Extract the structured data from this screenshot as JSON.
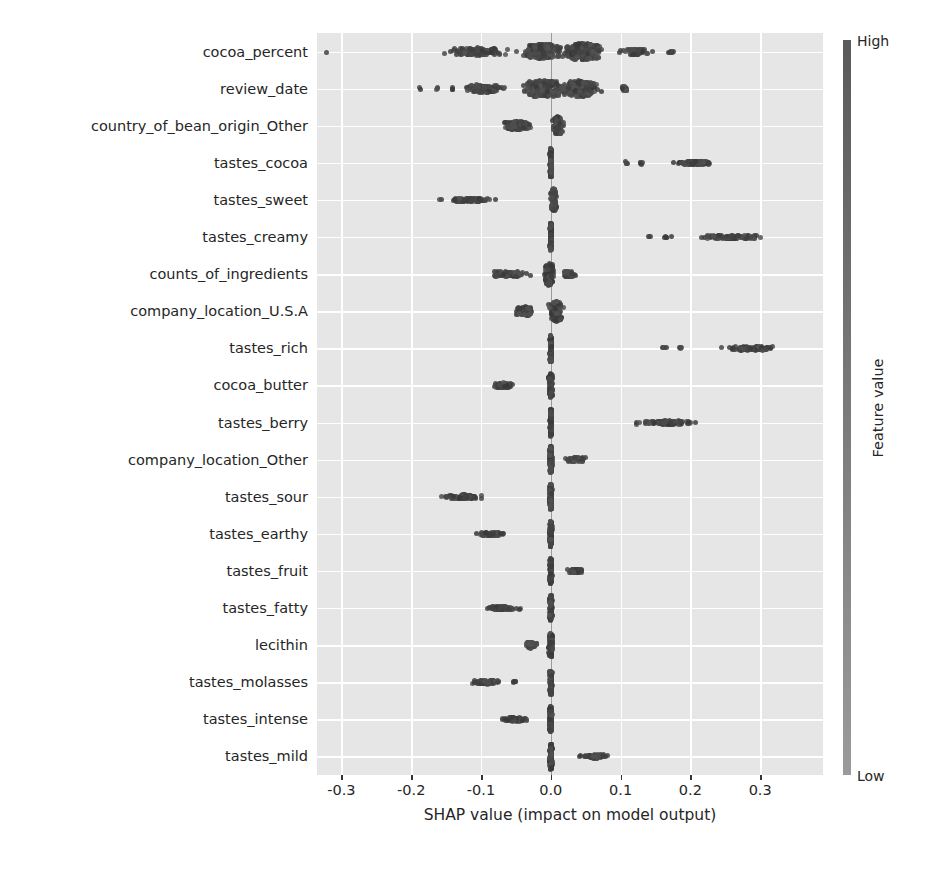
{
  "chart_data": {
    "type": "scatter",
    "plot_kind": "shap-beeswarm",
    "title": "",
    "xlabel": "SHAP value (impact on model output)",
    "ylabel": "",
    "xlim": [
      -0.335,
      0.39
    ],
    "xticks": [
      -0.3,
      -0.2,
      -0.1,
      0.0,
      0.1,
      0.2,
      0.3
    ],
    "xtick_labels": [
      "-0.3",
      "-0.2",
      "-0.1",
      "0.0",
      "0.1",
      "0.2",
      "0.3"
    ],
    "grid": true,
    "grid_color": "#ffffff",
    "plot_background": "#e6e6e6",
    "point_color": "#4a4a4a",
    "legend": {
      "type": "colorbar",
      "title": "Feature value",
      "high_label": "High",
      "low_label": "Low",
      "position": "right",
      "gradient_top": "#5a5a5a",
      "gradient_bottom": "#9a9a9a"
    },
    "categories": [
      "cocoa_percent",
      "review_date",
      "country_of_bean_origin_Other",
      "tastes_cocoa",
      "tastes_sweet",
      "tastes_creamy",
      "counts_of_ingredients",
      "company_location_U.S.A",
      "tastes_rich",
      "cocoa_butter",
      "tastes_berry",
      "company_location_Other",
      "tastes_sour",
      "tastes_earthy",
      "tastes_fruit",
      "tastes_fatty",
      "lecithin",
      "tastes_molasses",
      "tastes_intense",
      "tastes_mild"
    ],
    "series": [
      {
        "name": "cocoa_percent",
        "clusters": [
          {
            "center": -0.322,
            "half_width": 0.004,
            "count": 1,
            "spread": 0.5
          },
          {
            "center": -0.105,
            "half_width": 0.055,
            "count": 120,
            "spread": 1.3
          },
          {
            "center": -0.012,
            "half_width": 0.042,
            "count": 210,
            "spread": 2.6
          },
          {
            "center": 0.045,
            "half_width": 0.04,
            "count": 230,
            "spread": 3.0
          },
          {
            "center": 0.122,
            "half_width": 0.028,
            "count": 55,
            "spread": 1.0
          },
          {
            "center": 0.173,
            "half_width": 0.012,
            "count": 8,
            "spread": 0.5
          }
        ]
      },
      {
        "name": "review_date",
        "clusters": [
          {
            "center": -0.188,
            "half_width": 0.004,
            "count": 2,
            "spread": 0.5
          },
          {
            "center": -0.16,
            "half_width": 0.006,
            "count": 3,
            "spread": 0.5
          },
          {
            "center": -0.14,
            "half_width": 0.006,
            "count": 3,
            "spread": 0.5
          },
          {
            "center": -0.095,
            "half_width": 0.045,
            "count": 110,
            "spread": 1.4
          },
          {
            "center": -0.01,
            "half_width": 0.04,
            "count": 230,
            "spread": 3.0
          },
          {
            "center": 0.04,
            "half_width": 0.038,
            "count": 215,
            "spread": 2.8
          },
          {
            "center": 0.105,
            "half_width": 0.01,
            "count": 14,
            "spread": 0.7
          }
        ]
      },
      {
        "name": "country_of_bean_origin_Other",
        "clusters": [
          {
            "center": -0.048,
            "half_width": 0.03,
            "count": 110,
            "spread": 1.5
          },
          {
            "center": 0.01,
            "half_width": 0.01,
            "count": 130,
            "spread": 3.2
          }
        ]
      },
      {
        "name": "tastes_cocoa",
        "clusters": [
          {
            "center": 0.0,
            "half_width": 0.002,
            "count": 150,
            "spread": 5.2
          },
          {
            "center": 0.108,
            "half_width": 0.004,
            "count": 4,
            "spread": 0.5
          },
          {
            "center": 0.13,
            "half_width": 0.006,
            "count": 5,
            "spread": 0.5
          },
          {
            "center": 0.205,
            "half_width": 0.045,
            "count": 95,
            "spread": 0.7
          }
        ]
      },
      {
        "name": "tastes_sweet",
        "clusters": [
          {
            "center": -0.118,
            "half_width": 0.05,
            "count": 95,
            "spread": 0.7
          },
          {
            "center": 0.004,
            "half_width": 0.006,
            "count": 140,
            "spread": 4.2
          }
        ]
      },
      {
        "name": "tastes_creamy",
        "clusters": [
          {
            "center": 0.0,
            "half_width": 0.002,
            "count": 140,
            "spread": 5.0
          },
          {
            "center": 0.142,
            "half_width": 0.004,
            "count": 3,
            "spread": 0.5
          },
          {
            "center": 0.166,
            "half_width": 0.008,
            "count": 5,
            "spread": 0.5
          },
          {
            "center": 0.255,
            "half_width": 0.06,
            "count": 105,
            "spread": 0.7
          }
        ]
      },
      {
        "name": "counts_of_ingredients",
        "clusters": [
          {
            "center": -0.06,
            "half_width": 0.04,
            "count": 70,
            "spread": 1.0
          },
          {
            "center": -0.002,
            "half_width": 0.01,
            "count": 130,
            "spread": 4.0
          },
          {
            "center": 0.026,
            "half_width": 0.014,
            "count": 45,
            "spread": 1.0
          }
        ]
      },
      {
        "name": "company_location_U.S.A",
        "clusters": [
          {
            "center": -0.038,
            "half_width": 0.022,
            "count": 80,
            "spread": 1.6
          },
          {
            "center": 0.008,
            "half_width": 0.013,
            "count": 140,
            "spread": 3.6
          }
        ]
      },
      {
        "name": "tastes_rich",
        "clusters": [
          {
            "center": 0.0,
            "half_width": 0.002,
            "count": 140,
            "spread": 5.0
          },
          {
            "center": 0.162,
            "half_width": 0.006,
            "count": 4,
            "spread": 0.5
          },
          {
            "center": 0.185,
            "half_width": 0.006,
            "count": 4,
            "spread": 0.5
          },
          {
            "center": 0.285,
            "half_width": 0.055,
            "count": 100,
            "spread": 0.7
          }
        ]
      },
      {
        "name": "cocoa_butter",
        "clusters": [
          {
            "center": -0.068,
            "half_width": 0.028,
            "count": 60,
            "spread": 0.9
          },
          {
            "center": 0.0,
            "half_width": 0.004,
            "count": 130,
            "spread": 4.4
          }
        ]
      },
      {
        "name": "tastes_berry",
        "clusters": [
          {
            "center": 0.0,
            "half_width": 0.002,
            "count": 140,
            "spread": 5.0
          },
          {
            "center": 0.165,
            "half_width": 0.06,
            "count": 90,
            "spread": 0.7
          }
        ]
      },
      {
        "name": "company_location_Other",
        "clusters": [
          {
            "center": 0.0,
            "half_width": 0.003,
            "count": 135,
            "spread": 4.8
          },
          {
            "center": 0.036,
            "half_width": 0.022,
            "count": 60,
            "spread": 0.8
          }
        ]
      },
      {
        "name": "tastes_sour",
        "clusters": [
          {
            "center": -0.128,
            "half_width": 0.04,
            "count": 80,
            "spread": 0.7
          },
          {
            "center": 0.0,
            "half_width": 0.003,
            "count": 130,
            "spread": 4.6
          }
        ]
      },
      {
        "name": "tastes_earthy",
        "clusters": [
          {
            "center": -0.085,
            "half_width": 0.028,
            "count": 65,
            "spread": 0.7
          },
          {
            "center": 0.0,
            "half_width": 0.003,
            "count": 130,
            "spread": 4.6
          }
        ]
      },
      {
        "name": "tastes_fruit",
        "clusters": [
          {
            "center": 0.0,
            "half_width": 0.003,
            "count": 130,
            "spread": 4.6
          },
          {
            "center": 0.036,
            "half_width": 0.016,
            "count": 55,
            "spread": 0.7
          }
        ]
      },
      {
        "name": "tastes_fatty",
        "clusters": [
          {
            "center": -0.07,
            "half_width": 0.035,
            "count": 65,
            "spread": 0.7
          },
          {
            "center": 0.0,
            "half_width": 0.003,
            "count": 130,
            "spread": 4.6
          }
        ]
      },
      {
        "name": "lecithin",
        "clusters": [
          {
            "center": -0.03,
            "half_width": 0.014,
            "count": 50,
            "spread": 1.1
          },
          {
            "center": 0.0,
            "half_width": 0.004,
            "count": 130,
            "spread": 4.4
          }
        ]
      },
      {
        "name": "tastes_molasses",
        "clusters": [
          {
            "center": -0.092,
            "half_width": 0.032,
            "count": 60,
            "spread": 0.7
          },
          {
            "center": -0.052,
            "half_width": 0.005,
            "count": 5,
            "spread": 0.5
          },
          {
            "center": 0.0,
            "half_width": 0.003,
            "count": 130,
            "spread": 4.6
          }
        ]
      },
      {
        "name": "tastes_intense",
        "clusters": [
          {
            "center": -0.052,
            "half_width": 0.028,
            "count": 60,
            "spread": 0.7
          },
          {
            "center": 0.0,
            "half_width": 0.003,
            "count": 130,
            "spread": 4.6
          }
        ]
      },
      {
        "name": "tastes_mild",
        "clusters": [
          {
            "center": 0.0,
            "half_width": 0.003,
            "count": 130,
            "spread": 4.6
          },
          {
            "center": 0.062,
            "half_width": 0.026,
            "count": 60,
            "spread": 0.7
          }
        ]
      }
    ]
  }
}
